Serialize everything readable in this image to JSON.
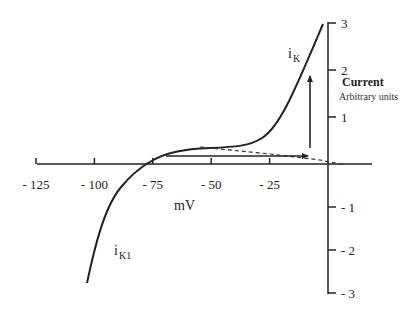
{
  "chart_data": {
    "type": "line",
    "title": "",
    "xlabel": "mV",
    "ylabel": "Current",
    "ylabel_sub": "Arbitrary units",
    "xlim": [
      -125,
      0
    ],
    "ylim": [
      -3,
      3
    ],
    "x_ticks": [
      {
        "value": -125,
        "label": "- 125"
      },
      {
        "value": -100,
        "label": "- 100"
      },
      {
        "value": -75,
        "label": "- 75"
      },
      {
        "value": -50,
        "label": "- 50"
      },
      {
        "value": -25,
        "label": "- 25"
      }
    ],
    "y_ticks": [
      {
        "value": 3,
        "label": "3"
      },
      {
        "value": 2,
        "label": "2"
      },
      {
        "value": 1,
        "label": "1"
      },
      {
        "value": -1,
        "label": "- 1"
      },
      {
        "value": -2,
        "label": "- 2"
      },
      {
        "value": -3,
        "label": "- 3"
      }
    ],
    "series": [
      {
        "name": "iK + iK1 (total)",
        "style": "solid",
        "points": [
          [
            -110,
            -2.55
          ],
          [
            -102,
            -1.6
          ],
          [
            -95,
            -0.8
          ],
          [
            -88,
            -0.3
          ],
          [
            -83,
            0.0
          ],
          [
            -75,
            0.22
          ],
          [
            -65,
            0.32
          ],
          [
            -55,
            0.35
          ],
          [
            -45,
            0.38
          ],
          [
            -35,
            0.5
          ],
          [
            -28,
            0.7
          ],
          [
            -20,
            1.2
          ],
          [
            -12,
            1.9
          ],
          [
            -5,
            2.7
          ],
          [
            -2,
            2.95
          ]
        ]
      },
      {
        "name": "extrapolation",
        "style": "dashed",
        "points": [
          [
            -55,
            0.35
          ],
          [
            -25,
            0.2
          ],
          [
            0,
            0.05
          ],
          [
            7,
            0
          ]
        ]
      }
    ],
    "annotations": [
      {
        "type": "label",
        "text": "i",
        "sub": "K",
        "near": [
          -15,
          2.3
        ]
      },
      {
        "type": "label",
        "text": "i",
        "sub": "K1",
        "near": [
          -95,
          -2.2
        ]
      },
      {
        "type": "arrow",
        "direction": "right",
        "from": [
          -67,
          0.17
        ],
        "to": [
          -8,
          0.17
        ]
      },
      {
        "type": "arrow",
        "direction": "up",
        "from": [
          -8,
          0.33
        ],
        "to": [
          -8,
          1.9
        ]
      }
    ],
    "grid": false,
    "legend": null
  },
  "labels": {
    "x_unit": "mV",
    "y_title": "Current",
    "y_subtitle": "Arbitrary units",
    "ik_main": "i",
    "ik_sub": "K",
    "ik1_main": "i",
    "ik1_sub": "K1"
  }
}
